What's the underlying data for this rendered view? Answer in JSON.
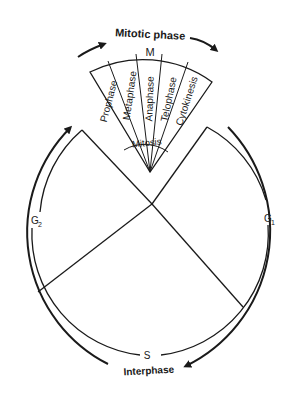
{
  "diagram": {
    "mitotic_label": "Mitotic phase",
    "m_label": "M",
    "mitosis_label": "Mitosis",
    "interphase_label": "Interphase",
    "phases": {
      "g1": {
        "letter": "G",
        "sub": "1"
      },
      "g2": {
        "letter": "G",
        "sub": "2"
      },
      "s": {
        "letter": "S"
      }
    },
    "mitosis_stages": [
      "Prophase",
      "Metaphase",
      "Anaphase",
      "Telophase",
      "Cytokinesis"
    ],
    "colors": {
      "stroke": "#1a1a1a",
      "background": "#ffffff"
    }
  }
}
